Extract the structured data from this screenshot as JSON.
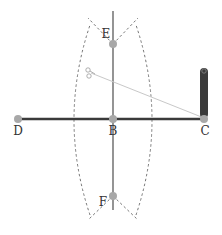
{
  "diagram": {
    "points": {
      "D": {
        "label": "D",
        "x": 18,
        "y": 119,
        "label_dx": 0,
        "label_dy": 16
      },
      "B": {
        "label": "B",
        "x": 113,
        "y": 119,
        "label_dx": 0,
        "label_dy": 16
      },
      "C": {
        "label": "C",
        "x": 204,
        "y": 119,
        "label_dx": 0,
        "label_dy": 16
      },
      "E": {
        "label": "E",
        "x": 113,
        "y": 44,
        "label_dx": -7,
        "label_dy": -6
      },
      "F": {
        "label": "F",
        "x": 113,
        "y": 196,
        "label_dx": -10,
        "label_dy": 6
      }
    },
    "segment_DC": {
      "from": "D",
      "to": "C"
    },
    "bisector_line": {
      "x": 113,
      "y1": 11,
      "y2": 210
    },
    "compass": {
      "pivot_icon": "scissors-icon",
      "pivot_x": 91,
      "pivot_y": 73,
      "pencil_x": 204,
      "pencil_top": 68,
      "pencil_bottom": 118
    },
    "colors": {
      "segment": "#3a3a3a",
      "bisector": "#7a7a7a",
      "point": "#a8a8a8",
      "arc": "#666666",
      "compass_arm": "#c8c8c8",
      "pencil": "#3b3b3b"
    }
  }
}
